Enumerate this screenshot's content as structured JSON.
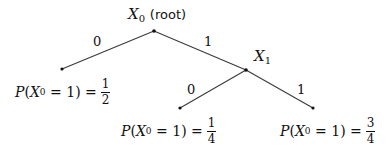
{
  "diagram": {
    "type": "binary-tree",
    "nodes": {
      "root": {
        "variable": "X",
        "subscript": "0",
        "suffix": "(root)",
        "x": 154,
        "y": 31
      },
      "x1": {
        "variable": "X",
        "subscript": "1",
        "x": 246,
        "y": 70
      },
      "leaf_left": {
        "x": 62,
        "y": 69,
        "label": {
          "func": "P",
          "variable": "X",
          "subscript": "0",
          "condition": "= 1",
          "equals": "=",
          "numerator": "1",
          "denominator": "2"
        }
      },
      "leaf_middle": {
        "x": 180,
        "y": 108,
        "label": {
          "func": "P",
          "variable": "X",
          "subscript": "0",
          "condition": "= 1",
          "equals": "=",
          "numerator": "1",
          "denominator": "4"
        }
      },
      "leaf_right": {
        "x": 313,
        "y": 108,
        "label": {
          "func": "P",
          "variable": "X",
          "subscript": "0",
          "condition": "= 1",
          "equals": "=",
          "numerator": "3",
          "denominator": "4"
        }
      }
    },
    "edges": [
      {
        "from": "root",
        "to": "leaf_left",
        "label": "0"
      },
      {
        "from": "root",
        "to": "x1",
        "label": "1"
      },
      {
        "from": "x1",
        "to": "leaf_middle",
        "label": "0"
      },
      {
        "from": "x1",
        "to": "leaf_right",
        "label": "1"
      }
    ]
  }
}
